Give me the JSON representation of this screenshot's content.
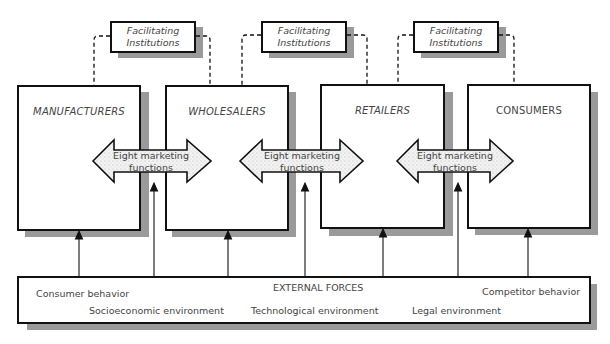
{
  "diagram": {
    "title_fragment": "",
    "facilitating_institutions": [
      {
        "line1": "Facilitating",
        "line2": "Institutions"
      },
      {
        "line1": "Facilitating",
        "line2": "Institutions"
      },
      {
        "line1": "Facilitating",
        "line2": "Institutions"
      }
    ],
    "channel_members": [
      {
        "label": "MANUFACTURERS"
      },
      {
        "label": "WHOLESALERS"
      },
      {
        "label": "RETAILERS"
      },
      {
        "label": "CONSUMERS"
      }
    ],
    "marketing_function_arrows": [
      {
        "line1": "Eight marketing",
        "line2": "functions"
      },
      {
        "line1": "Eight marketing",
        "line2": "functions"
      },
      {
        "line1": "Eight marketing",
        "line2": "functions"
      }
    ],
    "external_forces": {
      "title": "EXTERNAL FORCES",
      "items": [
        "Consumer behavior",
        "Socioeconomic environment",
        "Technological environment",
        "Legal environment",
        "Competitor behavior"
      ]
    },
    "colors": {
      "line": "#111111",
      "shadow": "#9a9a9a",
      "arrow_fill": "#eeeeee",
      "background": "#ffffff"
    }
  }
}
